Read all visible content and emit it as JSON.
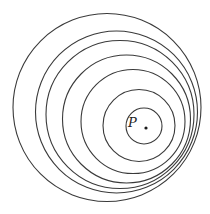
{
  "diagram": {
    "type": "nested-circles",
    "stroke_color": "#3a3a3a",
    "circles": [
      {
        "cx": 107,
        "cy": 107.5,
        "r": 94
      },
      {
        "cx": 116.5,
        "cy": 112,
        "r": 81
      },
      {
        "cx": 120,
        "cy": 114.5,
        "r": 74
      },
      {
        "cx": 126.5,
        "cy": 119,
        "r": 64
      },
      {
        "cx": 133,
        "cy": 121.5,
        "r": 52
      },
      {
        "cx": 139,
        "cy": 125.5,
        "r": 36
      },
      {
        "cx": 144,
        "cy": 126,
        "r": 18
      }
    ],
    "point": {
      "label": "P",
      "x": 146,
      "y": 128,
      "label_x": 128,
      "label_y": 127
    }
  }
}
